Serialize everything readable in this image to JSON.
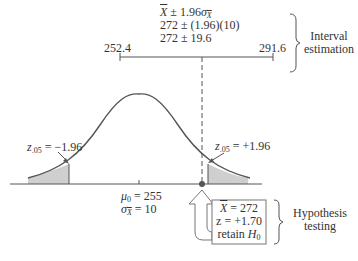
{
  "interval_estimation": {
    "formula_line1": "X̄ ± 1.96σX̄",
    "formula_line2": "272 ± (1.96)(10)",
    "formula_line3": "272 ± 19.6",
    "lower_bound": "252.4",
    "upper_bound": "291.6",
    "label_line1": "Interval",
    "label_line2": "estimation"
  },
  "distribution": {
    "left_critical_label": "z.05 = −1.96",
    "left_critical_sub": ".05",
    "left_critical_value": "= −1.96",
    "right_critical_sub": ".05",
    "right_critical_value": "= +1.96",
    "mean_label": "μ0 = 255",
    "mean_value": "= 255",
    "se_value": "= 10",
    "sigma_label": "σX̄ = 10"
  },
  "hypothesis_testing": {
    "sample_mean_value": "= 272",
    "z_value": "z = +1.70",
    "decision_prefix": "retain ",
    "decision_symbol": "H",
    "decision_sub": "0",
    "label_line1": "Hypothesis",
    "label_line2": "testing"
  },
  "colors": {
    "line": "#555555",
    "shade": "#cfcfcf",
    "text": "#333333"
  }
}
